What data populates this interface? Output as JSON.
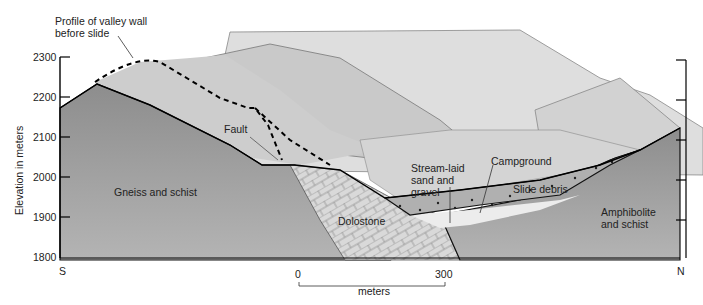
{
  "diagram": {
    "type": "geologic-cross-section",
    "y_axis": {
      "label": "Elevation in meters",
      "ticks": [
        "2300",
        "2200",
        "2100",
        "2000",
        "1900",
        "1800"
      ]
    },
    "direction": {
      "left": "S",
      "right": "N"
    },
    "scale_bar": {
      "start": "0",
      "end": "300",
      "unit": "meters"
    },
    "labels": {
      "profile": "Profile of valley wall",
      "profile_line2": "before slide",
      "fault": "Fault",
      "gneiss": "Gneiss and schist",
      "dolostone": "Dolostone",
      "stream_1": "Stream-laid",
      "stream_2": "sand and",
      "stream_3": "gravel",
      "campground": "Campground",
      "slide_debris": "Slide debris",
      "amphibolite_1": "Amphibolite",
      "amphibolite_2": "and schist"
    },
    "colors": {
      "bedrock": "#9e9e9e",
      "landscape": "#cfcfcf",
      "landscape_far": "#dcdcdc",
      "dolostone": "#d8d8d8",
      "debris": "#b3b3b3",
      "gravel": "#e6e6e6"
    }
  }
}
